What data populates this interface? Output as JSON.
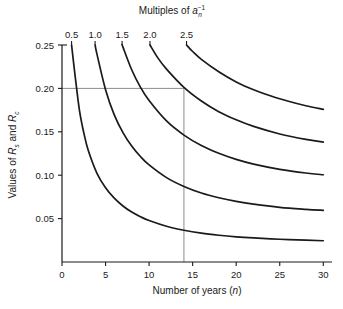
{
  "chart_data": {
    "type": "line",
    "title_plain": "Multiples of a_n^-1",
    "xlabel": "Number of years (n)",
    "ylabel": "Values of Rs and Rc",
    "ylabel_plain": "Values of R_s and R_c",
    "xlim": [
      0,
      31
    ],
    "ylim": [
      0.0,
      0.25
    ],
    "grid": false,
    "legend_position": "top-axis",
    "x_ticks": [
      0,
      5,
      10,
      15,
      20,
      25,
      30
    ],
    "x_tick_labels": [
      "0",
      "5",
      "10",
      "15",
      "20",
      "25",
      "30"
    ],
    "y_ticks": [
      0.05,
      0.1,
      0.15,
      0.2,
      0.25
    ],
    "y_tick_labels": [
      "0.05",
      "0.10",
      "0.15",
      "0.20",
      "0.25"
    ],
    "top_axis_label": "Multiples of a⁻¹n",
    "top_tick_labels": [
      "0.5",
      "1.0",
      "1.5",
      "2.0",
      "2.5"
    ],
    "top_tick_x": [
      1.1,
      3.8,
      6.9,
      10.1,
      14.3
    ],
    "series": [
      {
        "name": "0.5",
        "multiple": 0.5,
        "x": [
          1.1,
          1.5,
          2,
          2.5,
          3,
          4,
          5,
          6,
          7,
          8,
          9,
          10,
          12,
          14,
          16,
          18,
          20,
          22,
          25,
          28,
          30
        ],
        "values": [
          0.25,
          0.215,
          0.175,
          0.149,
          0.129,
          0.1025,
          0.0855,
          0.0735,
          0.0645,
          0.0575,
          0.0522,
          0.0478,
          0.0412,
          0.0366,
          0.0332,
          0.0308,
          0.029,
          0.0277,
          0.0262,
          0.0252,
          0.0245
        ]
      },
      {
        "name": "1.0",
        "multiple": 1.0,
        "x": [
          3.8,
          4,
          5,
          6,
          7,
          8,
          9,
          10,
          12,
          14,
          16,
          18,
          20,
          22,
          25,
          28,
          30
        ],
        "values": [
          0.25,
          0.24,
          0.1985,
          0.1695,
          0.149,
          0.1335,
          0.1215,
          0.1118,
          0.0972,
          0.087,
          0.0795,
          0.074,
          0.0698,
          0.0666,
          0.063,
          0.0607,
          0.0595
        ]
      },
      {
        "name": "1.5",
        "multiple": 1.5,
        "x": [
          6.9,
          7,
          8,
          9,
          10,
          12,
          14,
          16,
          18,
          20,
          22,
          25,
          28,
          30
        ],
        "values": [
          0.25,
          0.2475,
          0.2215,
          0.2015,
          0.186,
          0.1625,
          0.1462,
          0.1342,
          0.1252,
          0.1182,
          0.1128,
          0.1068,
          0.1025,
          0.1005
        ]
      },
      {
        "name": "2.0",
        "multiple": 2.0,
        "x": [
          10.1,
          11,
          12,
          14,
          16,
          18,
          20,
          22,
          25,
          28,
          30
        ],
        "values": [
          0.25,
          0.2352,
          0.2222,
          0.2012,
          0.1855,
          0.1732,
          0.1638,
          0.1562,
          0.1475,
          0.1412,
          0.1382
        ]
      },
      {
        "name": "2.5",
        "multiple": 2.5,
        "x": [
          14.3,
          15,
          16,
          18,
          20,
          22,
          24,
          26,
          28,
          30
        ],
        "values": [
          0.25,
          0.2425,
          0.2335,
          0.2192,
          0.2075,
          0.1985,
          0.1912,
          0.1852,
          0.18,
          0.1758
        ]
      }
    ],
    "reference_lines": [
      {
        "name": "horizontal-reference",
        "orientation": "horizontal",
        "value": 0.2,
        "x_from": 0,
        "x_to": 14
      },
      {
        "name": "vertical-reference",
        "orientation": "vertical",
        "value": 14,
        "y_from": 0.0,
        "y_to": 0.2
      }
    ],
    "colors": {
      "curve": "#1a1a1a",
      "axis": "#1a1a1a",
      "reference": "#8c8c8c",
      "background": "#ffffff"
    }
  }
}
